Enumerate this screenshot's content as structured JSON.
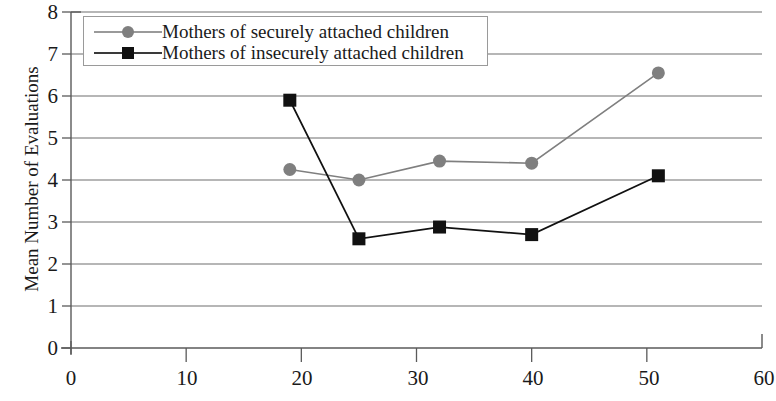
{
  "chart_data": {
    "type": "line",
    "title": "",
    "xlabel": "",
    "ylabel": "Mean Number of Evaluations",
    "xlim": [
      0,
      60
    ],
    "ylim": [
      0,
      8
    ],
    "xticks": [
      0,
      10,
      20,
      30,
      40,
      50,
      60
    ],
    "yticks": [
      0,
      1,
      2,
      3,
      4,
      5,
      6,
      7,
      8
    ],
    "grid": "horizontal",
    "legend_position": "top-left",
    "series": [
      {
        "name": "Mothers of securely attached children",
        "marker": "circle",
        "color": "#7f7f7f",
        "x": [
          19,
          25,
          32,
          40,
          51
        ],
        "y": [
          4.25,
          4.0,
          4.45,
          4.4,
          6.55
        ]
      },
      {
        "name": "Mothers of insecurely attached children",
        "marker": "square",
        "color": "#111111",
        "x": [
          19,
          25,
          32,
          40,
          51
        ],
        "y": [
          5.9,
          2.6,
          2.88,
          2.7,
          4.1
        ]
      }
    ]
  },
  "axes": {
    "y_title": "Mean Number of Evaluations",
    "y_tick_labels": [
      "8",
      "7",
      "6",
      "5",
      "4",
      "3",
      "2",
      "1",
      "0"
    ],
    "x_tick_labels": [
      "0",
      "10",
      "20",
      "30",
      "40",
      "50",
      "60"
    ]
  },
  "legend": {
    "entries": [
      {
        "label": "Mothers of securely attached children"
      },
      {
        "label": "Mothers of insecurely attached children"
      }
    ]
  },
  "colors": {
    "series_secure": "#7f7f7f",
    "series_insecure": "#111111",
    "gridline": "#6e6e6e",
    "axis": "#5a5a5a",
    "background": "#ffffff"
  }
}
